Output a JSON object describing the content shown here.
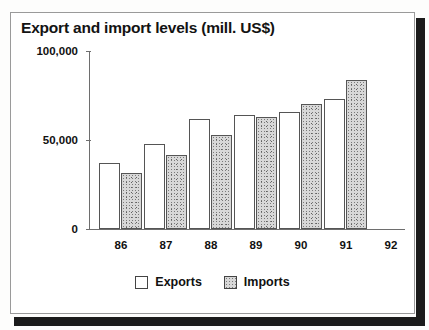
{
  "chart_data": {
    "type": "bar",
    "title": "Export and import levels (mill. US$)",
    "xlabel": "",
    "ylabel": "",
    "categories": [
      "86",
      "87",
      "88",
      "89",
      "90",
      "91",
      "92"
    ],
    "ylim": [
      0,
      100000
    ],
    "yticks": [
      0,
      50000,
      100000
    ],
    "ytick_labels": [
      "0",
      "50,000",
      "100,000"
    ],
    "grid": false,
    "legend_position": "bottom-center",
    "series": [
      {
        "name": "Exports",
        "swatch": "white",
        "values": [
          37000,
          47500,
          62000,
          64000,
          65500,
          73000,
          null
        ]
      },
      {
        "name": "Imports",
        "swatch": "stipple",
        "values": [
          31500,
          41500,
          53000,
          63000,
          70500,
          83500,
          null
        ]
      }
    ]
  },
  "chart": {
    "title": "Export and import levels (mill. US$)",
    "y_axis": {
      "labels": [
        "100,000",
        "50,000",
        "0"
      ],
      "values": [
        100000,
        50000,
        0
      ]
    },
    "x_axis": {
      "labels": [
        "86",
        "87",
        "88",
        "89",
        "90",
        "91",
        "92"
      ]
    },
    "legend": [
      {
        "label": "Exports",
        "swatch": "empty-square-icon"
      },
      {
        "label": "Imports",
        "swatch": "stippled-square-icon"
      }
    ]
  }
}
